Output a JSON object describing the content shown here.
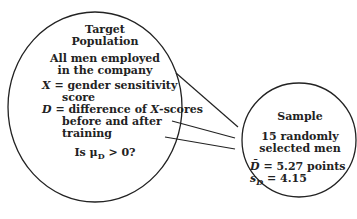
{
  "population": {
    "title_line1": "Target",
    "title_line2": "Population",
    "desc_line1": "All men employed",
    "desc_line2": "in the company",
    "x_var": "X",
    "x_def_line1": " = gender sensitivity",
    "x_def_line2": "score",
    "d_var": "D",
    "d_def_line1": " = difference of ",
    "d_def_x": "X",
    "d_def_line1b": "-scores",
    "d_def_line2": "before and after",
    "d_def_line3": "training",
    "question_pre": "Is μ",
    "question_sub": "D",
    "question_post": " > 0?"
  },
  "sample": {
    "title": "Sample",
    "desc_line1": "15 randomly",
    "desc_line2": "selected men",
    "dbar_var": "D̄",
    "dbar_value": " = 5.27 points",
    "sd_var": "s",
    "sd_sub": "D",
    "sd_value": " = 4.15"
  }
}
